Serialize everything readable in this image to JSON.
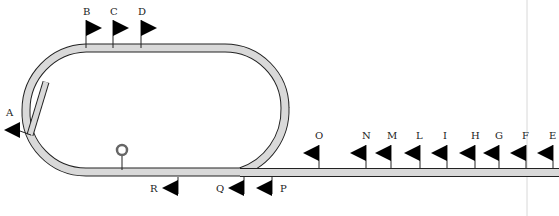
{
  "diagram": {
    "colors": {
      "track_fill": "#d9d9d9",
      "track_edge": "#222222",
      "flag": "#000000",
      "guide_line": "#cccccc"
    },
    "flags": [
      {
        "label": "A",
        "x": 20,
        "y": 122,
        "dir": "left"
      },
      {
        "label": "B",
        "x": 86,
        "y": 15,
        "dir": "right"
      },
      {
        "label": "C",
        "x": 113,
        "y": 15,
        "dir": "right"
      },
      {
        "label": "D",
        "x": 141,
        "y": 15,
        "dir": "right"
      },
      {
        "label": "O",
        "x": 319,
        "y": 145,
        "dir": "left"
      },
      {
        "label": "N",
        "x": 366,
        "y": 145,
        "dir": "left"
      },
      {
        "label": "M",
        "x": 391,
        "y": 145,
        "dir": "left"
      },
      {
        "label": "L",
        "x": 420,
        "y": 145,
        "dir": "left"
      },
      {
        "label": "I",
        "x": 447,
        "y": 145,
        "dir": "left"
      },
      {
        "label": "H",
        "x": 475,
        "y": 145,
        "dir": "left"
      },
      {
        "label": "G",
        "x": 499,
        "y": 145,
        "dir": "left"
      },
      {
        "label": "F",
        "x": 526,
        "y": 145,
        "dir": "left"
      },
      {
        "label": "E",
        "x": 553,
        "y": 145,
        "dir": "left"
      },
      {
        "label": "R",
        "x": 178,
        "y": 180,
        "dir": "left"
      },
      {
        "label": "Q",
        "x": 244,
        "y": 180,
        "dir": "left"
      },
      {
        "label": "P",
        "x": 272,
        "y": 180,
        "dir": "left"
      }
    ],
    "marker": {
      "name": "ring",
      "x": 122,
      "y": 150
    }
  }
}
